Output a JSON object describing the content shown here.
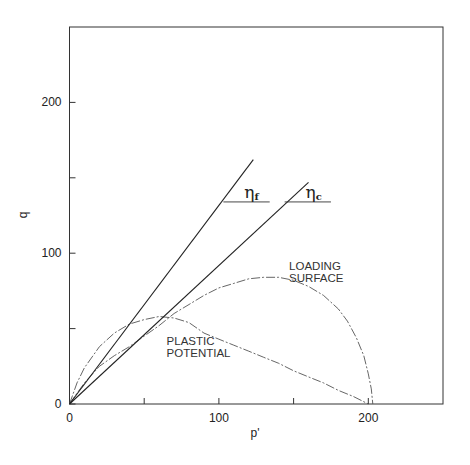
{
  "chart_data": {
    "type": "line",
    "title": "",
    "xlabel": "p'",
    "ylabel": "q",
    "xlim": [
      0,
      250
    ],
    "ylim": [
      0,
      250
    ],
    "x_ticks": [
      0,
      50,
      100,
      150,
      200
    ],
    "x_tick_labels": [
      "0",
      "",
      "100",
      "",
      "200"
    ],
    "y_ticks": [
      0,
      50,
      100,
      150,
      200
    ],
    "y_tick_labels": [
      "0",
      "",
      "100",
      "",
      "200"
    ],
    "grid": false,
    "series": [
      {
        "name": "Loading surface",
        "style": "dash-dot",
        "points": [
          [
            0,
            0
          ],
          [
            10,
            14
          ],
          [
            20,
            25
          ],
          [
            30,
            32
          ],
          [
            40,
            38
          ],
          [
            50,
            45
          ],
          [
            60,
            52
          ],
          [
            70,
            60
          ],
          [
            80,
            66
          ],
          [
            90,
            72
          ],
          [
            100,
            77
          ],
          [
            110,
            80
          ],
          [
            120,
            83
          ],
          [
            130,
            84
          ],
          [
            140,
            84
          ],
          [
            150,
            82
          ],
          [
            160,
            78
          ],
          [
            170,
            72
          ],
          [
            180,
            63
          ],
          [
            186,
            55
          ],
          [
            192,
            44
          ],
          [
            197,
            32
          ],
          [
            200,
            20
          ],
          [
            202,
            10
          ],
          [
            203,
            0
          ]
        ]
      },
      {
        "name": "Plastic potential",
        "style": "dash-dot",
        "points": [
          [
            0,
            0
          ],
          [
            5,
            14
          ],
          [
            10,
            24
          ],
          [
            20,
            38
          ],
          [
            30,
            47
          ],
          [
            40,
            53
          ],
          [
            50,
            56
          ],
          [
            60,
            58
          ],
          [
            70,
            57
          ],
          [
            80,
            54
          ],
          [
            90,
            47
          ],
          [
            100,
            43
          ],
          [
            110,
            39
          ],
          [
            120,
            35
          ],
          [
            130,
            31
          ],
          [
            140,
            27
          ],
          [
            150,
            22
          ],
          [
            160,
            18
          ],
          [
            170,
            14
          ],
          [
            180,
            9
          ],
          [
            190,
            5
          ],
          [
            200,
            0
          ]
        ]
      },
      {
        "name": "eta_f line",
        "style": "solid",
        "points": [
          [
            0,
            0
          ],
          [
            123,
            162
          ]
        ]
      },
      {
        "name": "eta_c line",
        "style": "solid",
        "points": [
          [
            0,
            0
          ],
          [
            160,
            147
          ]
        ]
      }
    ],
    "annotations": [
      {
        "text": "LOADING",
        "at": [
          147,
          89
        ]
      },
      {
        "text": "SURFACE",
        "at": [
          147,
          81
        ]
      },
      {
        "text": "PLASTIC",
        "at": [
          65,
          39
        ]
      },
      {
        "text": "POTENTIAL",
        "at": [
          65,
          31
        ]
      },
      {
        "symbol": "η",
        "subscript": "f",
        "at": [
          117,
          134
        ],
        "underline": [
          103,
          134,
          134
        ]
      },
      {
        "symbol": "η",
        "subscript": "c",
        "at": [
          158,
          134
        ],
        "underline": [
          144,
          134,
          175
        ]
      }
    ]
  }
}
